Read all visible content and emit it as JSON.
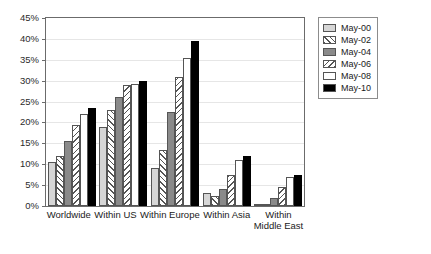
{
  "chart_data": {
    "type": "bar",
    "title": "",
    "xlabel": "",
    "ylabel": "",
    "ylim": [
      0,
      45
    ],
    "grid": true,
    "legend_position": "top-right",
    "categories": [
      "Worldwide",
      "Within US",
      "Within Europe",
      "Within Asia",
      "Within\nMiddle East"
    ],
    "ytick_labels": [
      "45%",
      "40%",
      "35%",
      "30%",
      "25%",
      "20%",
      "15%",
      "10%",
      "5%",
      "0%"
    ],
    "ytick_values": [
      45,
      40,
      35,
      30,
      25,
      20,
      15,
      10,
      5,
      0
    ],
    "series": [
      {
        "name": "May-00",
        "pattern": "light-gray-solid",
        "values": [
          10.5,
          19.0,
          9.0,
          3.0,
          0.5
        ]
      },
      {
        "name": "May-02",
        "pattern": "forward-diagonal-hatch",
        "values": [
          12.0,
          23.0,
          13.5,
          2.5,
          0.5
        ]
      },
      {
        "name": "May-04",
        "pattern": "dark-gray-solid",
        "values": [
          15.5,
          26.0,
          22.5,
          4.0,
          2.0
        ]
      },
      {
        "name": "May-06",
        "pattern": "backward-diagonal-hatch",
        "values": [
          19.5,
          29.0,
          31.0,
          7.5,
          4.5
        ]
      },
      {
        "name": "May-08",
        "pattern": "white-solid",
        "values": [
          22.0,
          29.3,
          35.5,
          11.0,
          7.0
        ]
      },
      {
        "name": "May-10",
        "pattern": "black-solid",
        "values": [
          23.5,
          30.0,
          39.5,
          12.0,
          7.5
        ]
      }
    ],
    "annotations": [
      "Reprinted by permission of the International Air Transport Association (IATA)."
    ]
  },
  "credit": {
    "text": "Reprinted by permission of the International Air Transport\nAssociation (IATA)."
  },
  "colors": {
    "axis": "#6b6b6b",
    "grid": "#e6e6e6",
    "series_00": "#d6d6d6",
    "series_04": "#8a8a8a",
    "series_10": "#000000",
    "text": "#1a1a1a"
  }
}
